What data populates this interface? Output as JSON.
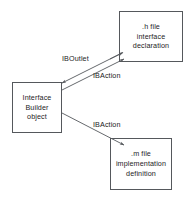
{
  "diagram": {
    "background_color": "#ffffff",
    "stroke_color": "#55585c",
    "text_color": "#1d1d1d",
    "nodes": [
      {
        "id": "h-file",
        "lines": [
          ".h file",
          "interface",
          "declaration"
        ]
      },
      {
        "id": "ib-object",
        "lines": [
          "Interface",
          "Builder",
          "object"
        ]
      },
      {
        "id": "m-file",
        "lines": [
          ".m file",
          "implementation",
          "definition"
        ]
      }
    ],
    "edges": [
      {
        "id": "outlet",
        "label": "IBOutlet",
        "from": "h-file",
        "to": "ib-object"
      },
      {
        "id": "action-h",
        "label": "IBAction",
        "from": "ib-object",
        "to": "h-file"
      },
      {
        "id": "action-m",
        "label": "IBAction",
        "from": "ib-object",
        "to": "m-file"
      }
    ]
  }
}
